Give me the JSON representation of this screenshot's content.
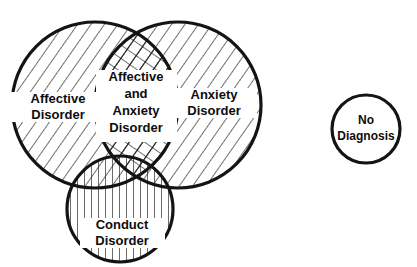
{
  "diagram": {
    "type": "venn",
    "background_color": "#ffffff",
    "stroke_color": "#141414",
    "hatch_color": "#1a1a1a",
    "label_color": "#0d0d0d",
    "sets": [
      {
        "id": "affective",
        "label": "Affective\nDisorder",
        "label_lines": [
          "Affective",
          "Disorder"
        ],
        "fill_pattern": "diagonal-backslash",
        "cx": 95,
        "cy": 105,
        "r": 83
      },
      {
        "id": "anxiety",
        "label": "Anxiety\nDisorder",
        "label_lines": [
          "Anxiety",
          "Disorder"
        ],
        "fill_pattern": "diagonal-backslash",
        "cx": 178,
        "cy": 105,
        "r": 83
      },
      {
        "id": "conduct",
        "label": "Conduct\nDisorder",
        "label_lines": [
          "Conduct",
          "Disorder"
        ],
        "fill_pattern": "vertical",
        "cx": 120,
        "cy": 209,
        "r": 53
      },
      {
        "id": "no-diagnosis",
        "label": "No\nDiagnosis",
        "label_lines": [
          "No",
          "Diagnosis"
        ],
        "fill_pattern": "none",
        "cx": 366,
        "cy": 129,
        "r": 34
      }
    ],
    "intersections": [
      {
        "id": "affective-anxiety",
        "label": "Affective\nand\nAnxiety\nDisorder",
        "label_lines": [
          "Affective",
          "and",
          "Anxiety",
          "Disorder"
        ],
        "fill_pattern": "crosshatch",
        "members": [
          "affective",
          "anxiety"
        ]
      }
    ],
    "labels": {
      "affective": {
        "line1": "Affective",
        "line2": "Disorder",
        "x": 58,
        "y": 106,
        "font_size": 13
      },
      "anxiety": {
        "line1": "Anxiety",
        "line2": "Disorder",
        "x": 214,
        "y": 102,
        "font_size": 13
      },
      "intersection": {
        "line1": "Affective",
        "line2": "and",
        "line3": "Anxiety",
        "line4": "Disorder",
        "x": 136,
        "y": 105,
        "font_size": 13
      },
      "conduct": {
        "line1": "Conduct",
        "line2": "Disorder",
        "x": 122,
        "y": 232,
        "font_size": 13
      },
      "no_diagnosis": {
        "line1": "No",
        "line2": "Diagnosis",
        "x": 366,
        "y": 129,
        "font_size": 12
      }
    }
  }
}
